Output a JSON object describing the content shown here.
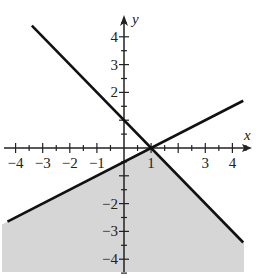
{
  "chart_data": {
    "type": "line",
    "title": "",
    "xlabel": "x",
    "ylabel": "y",
    "xlim": [
      -4.4,
      4.7
    ],
    "ylim": [
      -4.5,
      4.6
    ],
    "grid": false,
    "x_ticks": [
      -4,
      -3,
      -2,
      -1,
      0,
      1,
      2,
      3,
      4
    ],
    "x_tick_labels": [
      "−4",
      "−3",
      "−2",
      "−1",
      "1",
      "3",
      "4"
    ],
    "x_tick_label_values": [
      -4,
      -3,
      -2,
      -1,
      1,
      3,
      4
    ],
    "y_ticks": [
      -4,
      -3,
      -2,
      -1,
      1,
      2,
      3,
      4
    ],
    "y_tick_labels": [
      "4",
      "3",
      "2",
      "−2",
      "−3",
      "−4"
    ],
    "y_tick_label_values": [
      4,
      3,
      2,
      -2,
      -3,
      -4
    ],
    "series": [
      {
        "name": "rising boundary",
        "equation": "y = 0.5x - 0.5",
        "x": [
          -4.3,
          4.4
        ],
        "y": [
          -2.65,
          1.7
        ],
        "color": "#111111"
      },
      {
        "name": "falling boundary",
        "equation": "y = -x + 1",
        "x": [
          -3.4,
          4.4
        ],
        "y": [
          4.4,
          -3.4
        ],
        "color": "#111111"
      }
    ],
    "intersection": {
      "x": 1,
      "y": 0
    },
    "shaded_region": {
      "description": "region below both lines",
      "inequalities": [
        "y <= 0.5x - 0.5",
        "y <= -x + 1"
      ],
      "color": "#d4d4d4"
    }
  },
  "labels": {
    "x_axis": "x",
    "y_axis": "y",
    "xticks": [
      {
        "text": "−4",
        "v": -4
      },
      {
        "text": "−3",
        "v": -3
      },
      {
        "text": "−2",
        "v": -2
      },
      {
        "text": "−1",
        "v": -1
      },
      {
        "text": "1",
        "v": 1
      },
      {
        "text": "3",
        "v": 3
      },
      {
        "text": "4",
        "v": 4
      }
    ],
    "yticks": [
      {
        "text": "4",
        "v": 4
      },
      {
        "text": "3",
        "v": 3
      },
      {
        "text": "2",
        "v": 2
      },
      {
        "text": "−2",
        "v": -2
      },
      {
        "text": "−3",
        "v": -3
      },
      {
        "text": "−4",
        "v": -4
      }
    ]
  }
}
